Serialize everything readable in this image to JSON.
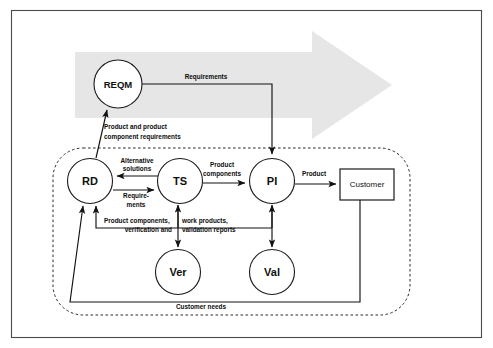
{
  "diagram": {
    "background_arrow": {
      "name": "process-flow-arrow",
      "color": "#e6e6e6",
      "direction": "right"
    },
    "frame_color": "#4a4a4a",
    "boundary": {
      "name": "engineering-process-boundary",
      "style": "dashed-rounded-rectangle"
    },
    "nodes": [
      {
        "id": "reqm",
        "label": "REQM",
        "shape": "circle",
        "cx": 118,
        "cy": 84,
        "r": 24
      },
      {
        "id": "rd",
        "label": "RD",
        "shape": "circle",
        "cx": 90,
        "cy": 181,
        "r": 22.5
      },
      {
        "id": "ts",
        "label": "TS",
        "shape": "circle",
        "cx": 180,
        "cy": 181,
        "r": 22.5
      },
      {
        "id": "pi",
        "label": "PI",
        "shape": "circle",
        "cx": 272,
        "cy": 181,
        "r": 22.5
      },
      {
        "id": "ver",
        "label": "Ver",
        "shape": "circle",
        "cx": 178,
        "cy": 272,
        "r": 22.5
      },
      {
        "id": "val",
        "label": "Val",
        "shape": "circle",
        "cx": 272,
        "cy": 272,
        "r": 22.5
      },
      {
        "id": "customer",
        "label": "Customer",
        "shape": "rectangle",
        "x": 340,
        "y": 169,
        "w": 54,
        "h": 31
      }
    ],
    "edges": [
      {
        "id": "reqm-pi",
        "label": "Requirements",
        "from": "reqm",
        "to": "pi"
      },
      {
        "id": "rd-reqm",
        "label_line1": "Product and product",
        "label_line2": "component requirements",
        "from": "rd",
        "to": "reqm"
      },
      {
        "id": "ts-rd",
        "label_line1": "Alternative",
        "label_line2": "solutions",
        "from": "ts",
        "to": "rd"
      },
      {
        "id": "rd-ts",
        "label_line1": "Require-",
        "label_line2": "ments",
        "from": "rd",
        "to": "ts"
      },
      {
        "id": "ts-pi",
        "label_line1": "Product",
        "label_line2": "components",
        "from": "ts",
        "to": "pi"
      },
      {
        "id": "pi-customer",
        "label": "Product",
        "from": "pi",
        "to": "customer"
      },
      {
        "id": "feedback-left",
        "label_line1": "Product components,",
        "label_line2": "verification and",
        "from": "ver",
        "to": "rd"
      },
      {
        "id": "feedback-right",
        "label_line1": "work products,",
        "label_line2": "validation reports",
        "from": "val",
        "to": "ts"
      },
      {
        "id": "customer-needs",
        "label": "Customer needs",
        "from": "customer",
        "to": "rd"
      }
    ]
  }
}
